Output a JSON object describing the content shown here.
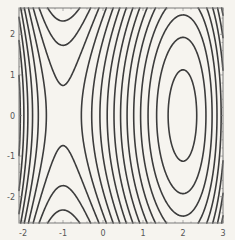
{
  "chart_data": {
    "type": "contour",
    "title": "",
    "xlabel": "",
    "ylabel": "",
    "function": "x^3/3 - x^2/2 - 2x + 0.15 y^2",
    "xlim": [
      -2.1,
      3.0
    ],
    "ylim": [
      -2.65,
      2.65
    ],
    "xticks": [
      -2,
      -1,
      0,
      1,
      2,
      3
    ],
    "yticks": [
      -2,
      -1,
      0,
      1,
      2
    ],
    "xtick_labels": [
      "-2",
      "-1",
      "0",
      "1",
      "2",
      "3"
    ],
    "ytick_labels": [
      "-2",
      "-1",
      "0",
      "1",
      "2"
    ],
    "contour_levels": {
      "base": 1.249,
      "step": 0.366,
      "n_min": -12,
      "n_max": 14
    },
    "critical_points": [
      {
        "x": -1,
        "y": 0,
        "kind": "saddle"
      },
      {
        "x": 2,
        "y": 0,
        "kind": "minimum"
      }
    ],
    "grid": false,
    "legend": null,
    "colors": {
      "background": "#f6f4ef",
      "frame": "#7a7a7a",
      "contour": "#3c3c3c",
      "tick_label": "#555555"
    }
  }
}
